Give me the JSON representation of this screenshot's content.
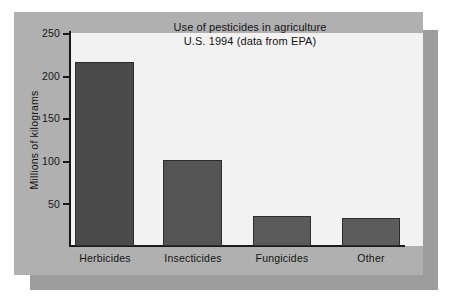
{
  "figure": {
    "background_color": "#ffffff",
    "panel_color": "#b0b0b0",
    "plot_background_color": "#f2f2f2",
    "shadow_color": "#9d9d9d",
    "axis_color": "#1a1a1a"
  },
  "chart_data": {
    "type": "bar",
    "title": "Use of pesticides in agriculture\nU.S. 1994 (data from EPA)",
    "title_line1": "Use of pesticides in agriculture",
    "title_line2": "U.S. 1994 (data from EPA)",
    "xlabel": "",
    "ylabel": "Millions of kilograms",
    "categories": [
      "Herbicides",
      "Insecticides",
      "Fungicides",
      "Other"
    ],
    "values": [
      216,
      101,
      35,
      33
    ],
    "ylim": [
      0,
      250
    ],
    "yticks": [
      50,
      100,
      150,
      200,
      250
    ],
    "ytick_labels": [
      "50",
      "100",
      "150",
      "200",
      "250"
    ],
    "grid": false,
    "legend": false,
    "bar_colors": [
      "#4a4a4a",
      "#545454",
      "#5a5a5a",
      "#5c5c5c"
    ],
    "bar_edge_color": "#2d2d2d"
  }
}
